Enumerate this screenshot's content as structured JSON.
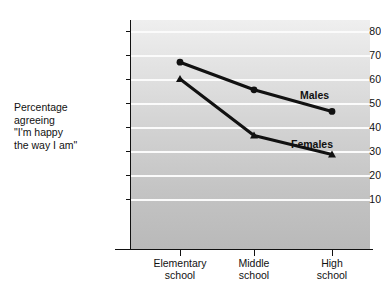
{
  "axis_description": "Percentage\nagreeing\n\"I'm happy\nthe way I am\"",
  "labels": {
    "males": "Males",
    "females": "Females"
  },
  "chart_data": {
    "type": "line",
    "title": "",
    "subtitle": "",
    "xlabel": "",
    "ylabel": "Percentage agreeing \"I'm happy the way I am\"",
    "categories": [
      "Elementary school",
      "Middle school",
      "High school"
    ],
    "category_lines": [
      [
        "Elementary",
        "school"
      ],
      [
        "Middle",
        "school"
      ],
      [
        "High",
        "school"
      ]
    ],
    "series": [
      {
        "name": "Males",
        "marker": "circle",
        "values": [
          67,
          55.5,
          46.5
        ]
      },
      {
        "name": "Females",
        "marker": "triangle",
        "values": [
          60,
          36.5,
          28.5
        ]
      }
    ],
    "ylim": [
      0,
      85
    ],
    "yticks": [
      10,
      20,
      30,
      40,
      50,
      60,
      70,
      80
    ],
    "ytick_labels": [
      "10",
      "20",
      "30",
      "40",
      "50",
      "60",
      "70",
      "80"
    ],
    "grid": true,
    "grid_color": "#fbfbfb",
    "legend_position": "inline-right",
    "line_color": "#111111",
    "plot_background_top": "#efefef",
    "plot_background_bottom": "#b9b9b9"
  }
}
